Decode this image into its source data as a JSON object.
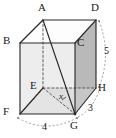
{
  "figure": {
    "type": "geometric-solid-diagram",
    "shape_name": "rectangular-prism",
    "colors": {
      "outline": "#2b2b2b",
      "hidden_edge": "#555555",
      "face_front_left": "#ededed",
      "face_right_dark": "#b9b9b9",
      "face_top": "#ffffff",
      "label_text": "#1a1a1a",
      "arc": "#777777",
      "background": "#ffffff"
    },
    "vertices": [
      {
        "id": "A",
        "label": "A",
        "x": 43,
        "y": 20,
        "label_x": 38,
        "label_y": 3
      },
      {
        "id": "B",
        "label": "B",
        "x": 20,
        "y": 43,
        "label_x": 4,
        "label_y": 36
      },
      {
        "id": "C",
        "label": "C",
        "x": 75,
        "y": 43,
        "label_x": 76,
        "label_y": 38
      },
      {
        "id": "D",
        "label": "D",
        "x": 96,
        "y": 20,
        "label_x": 92,
        "label_y": 3
      },
      {
        "id": "E",
        "label": "E",
        "x": 43,
        "y": 88,
        "label_x": 31,
        "label_y": 82
      },
      {
        "id": "F",
        "label": "F",
        "x": 20,
        "y": 114,
        "label_x": 4,
        "label_y": 108
      },
      {
        "id": "G",
        "label": "G",
        "x": 75,
        "y": 114,
        "label_x": 70,
        "label_y": 119
      },
      {
        "id": "H",
        "label": "H",
        "x": 96,
        "y": 88,
        "label_x": 97,
        "label_y": 84
      }
    ],
    "dimension_labels": [
      {
        "id": "edge-dh",
        "text": "5",
        "x": 104,
        "y": 46,
        "italic": false
      },
      {
        "id": "edge-gh",
        "text": "3",
        "x": 88,
        "y": 104,
        "italic": false
      },
      {
        "id": "edge-fg",
        "text": "4",
        "x": 44,
        "y": 123,
        "italic": false
      },
      {
        "id": "diagonal-eg",
        "text": "x",
        "x": 60,
        "y": 93,
        "italic": true
      }
    ],
    "measure_arcs": [
      {
        "id": "arc-5",
        "from": "D",
        "to": "H",
        "label": "5"
      },
      {
        "id": "arc-3",
        "from": "G",
        "to": "H",
        "label": "3"
      },
      {
        "id": "arc-4",
        "from": "F",
        "to": "G",
        "label": "4"
      }
    ],
    "solid_edges": [
      "A-B",
      "A-D",
      "B-C",
      "C-D",
      "B-F",
      "C-G",
      "D-H",
      "F-G",
      "G-H",
      "A-G",
      "E-F",
      "F-G"
    ],
    "hidden_edges": [
      "A-E",
      "E-F",
      "E-H",
      "E-G"
    ]
  }
}
